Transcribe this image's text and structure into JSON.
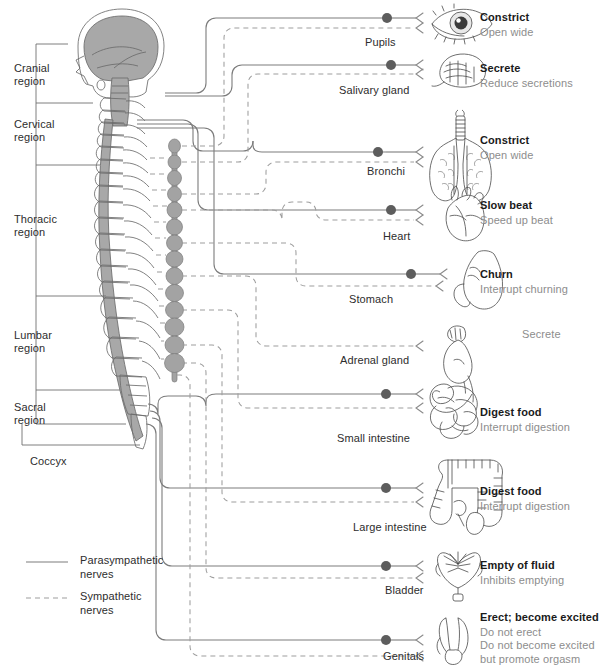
{
  "diagram": {
    "colors": {
      "parasympathetic_line": "#7c7c7c",
      "sympathetic_line": "#9e9e9e",
      "ganglion": "#5d5d5d",
      "effect_parasympathetic_text": "#1a1a1a",
      "effect_sympathetic_text": "#8d8d8d",
      "label_text": "#2d2d2d",
      "background": "#ffffff",
      "brain_fill": "#a8a8a8",
      "chain_fill": "#a3a3a3"
    }
  },
  "spine_regions": [
    {
      "name": "cranial",
      "label": "Cranial\nregion"
    },
    {
      "name": "cervical",
      "label": "Cervical\nregion"
    },
    {
      "name": "thoracic",
      "label": "Thoracic\nregion"
    },
    {
      "name": "lumbar",
      "label": "Lumbar\nregion"
    },
    {
      "name": "sacral",
      "label": "Sacral\nregion"
    },
    {
      "name": "coccyx",
      "label": "Coccyx"
    }
  ],
  "organs": [
    {
      "name": "pupils",
      "label": "Pupils",
      "icon": "eye-icon",
      "parasympathetic_effect": "Constrict",
      "sympathetic_effect": "Open wide",
      "has_parasympathetic": true,
      "has_sympathetic": true
    },
    {
      "name": "salivary-gland",
      "label": "Salivary gland",
      "icon": "salivary-gland-icon",
      "parasympathetic_effect": "Secrete",
      "sympathetic_effect": "Reduce secretions",
      "has_parasympathetic": true,
      "has_sympathetic": true
    },
    {
      "name": "bronchi",
      "label": "Bronchi",
      "icon": "lungs-icon",
      "parasympathetic_effect": "Constrict",
      "sympathetic_effect": "Open wide",
      "has_parasympathetic": true,
      "has_sympathetic": true
    },
    {
      "name": "heart",
      "label": "Heart",
      "icon": "heart-icon",
      "parasympathetic_effect": "Slow beat",
      "sympathetic_effect": "Speed up beat",
      "has_parasympathetic": true,
      "has_sympathetic": true
    },
    {
      "name": "stomach",
      "label": "Stomach",
      "icon": "stomach-icon",
      "parasympathetic_effect": "Churn",
      "sympathetic_effect": "Interrupt churning",
      "has_parasympathetic": true,
      "has_sympathetic": true
    },
    {
      "name": "adrenal-gland",
      "label": "Adrenal gland",
      "icon": "adrenal-gland-icon",
      "parasympathetic_effect": "",
      "sympathetic_effect": "Secrete",
      "has_parasympathetic": false,
      "has_sympathetic": true
    },
    {
      "name": "small-intestine",
      "label": "Small intestine",
      "icon": "small-intestine-icon",
      "parasympathetic_effect": "Digest food",
      "sympathetic_effect": "Interrupt digestion",
      "has_parasympathetic": true,
      "has_sympathetic": true
    },
    {
      "name": "large-intestine",
      "label": "Large intestine",
      "icon": "large-intestine-icon",
      "parasympathetic_effect": "Digest food",
      "sympathetic_effect": "Interrupt digestion",
      "has_parasympathetic": true,
      "has_sympathetic": true
    },
    {
      "name": "bladder",
      "label": "Bladder",
      "icon": "bladder-icon",
      "parasympathetic_effect": "Empty of fluid",
      "sympathetic_effect": "Inhibits emptying",
      "has_parasympathetic": true,
      "has_sympathetic": true
    },
    {
      "name": "genitals",
      "label": "Genitals",
      "icon": "genitals-icon",
      "parasympathetic_effect": "Erect; become excited",
      "sympathetic_effect": "Do not erect\nDo not become excited\nbut promote orgasm",
      "has_parasympathetic": true,
      "has_sympathetic": true
    }
  ],
  "legend": [
    {
      "name": "parasympathetic",
      "style": "solid",
      "label": "Parasympathetic\nnerves"
    },
    {
      "name": "sympathetic",
      "style": "dashed",
      "label": "Sympathetic\nnerves"
    }
  ]
}
